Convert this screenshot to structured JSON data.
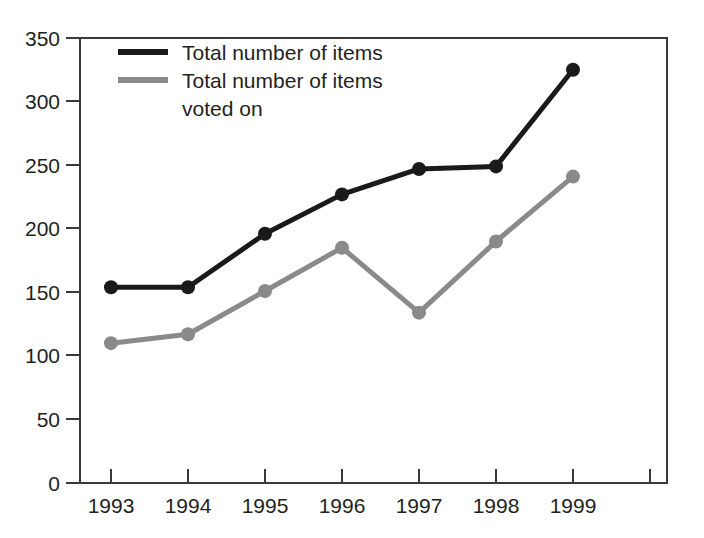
{
  "chart_data": {
    "type": "line",
    "title": "",
    "xlabel": "",
    "ylabel": "",
    "categories": [
      "1993",
      "1994",
      "1995",
      "1996",
      "1997",
      "1998",
      "1999"
    ],
    "x": [
      1993,
      1994,
      1995,
      1996,
      1997,
      1998,
      1999
    ],
    "series": [
      {
        "name": "Total number of items",
        "color": "#1a1a1a",
        "values": [
          154,
          154,
          196,
          227,
          247,
          249,
          325
        ],
        "marker": "circle"
      },
      {
        "name": "Total number of items voted on",
        "color": "#8a8a8a",
        "values": [
          110,
          117,
          151,
          185,
          134,
          190,
          241
        ],
        "marker": "circle"
      }
    ],
    "ylim": [
      0,
      350
    ],
    "yticks": [
      0,
      50,
      100,
      150,
      200,
      250,
      300,
      350
    ],
    "ytick_labels": [
      "0",
      "50",
      "100",
      "150",
      "200",
      "250",
      "300",
      "350"
    ],
    "xtick_labels": [
      "1993",
      "1994",
      "1995",
      "1996",
      "1997",
      "1998",
      "1999"
    ],
    "grid": false,
    "legend_position": "top-left",
    "legend": [
      {
        "label_line1": "Total number of items",
        "label_line2": "",
        "color": "#1a1a1a"
      },
      {
        "label_line1": "Total number of items",
        "label_line2": "voted on",
        "color": "#8a8a8a"
      }
    ]
  },
  "axes": {
    "frame_color": "#3a3a3a"
  }
}
